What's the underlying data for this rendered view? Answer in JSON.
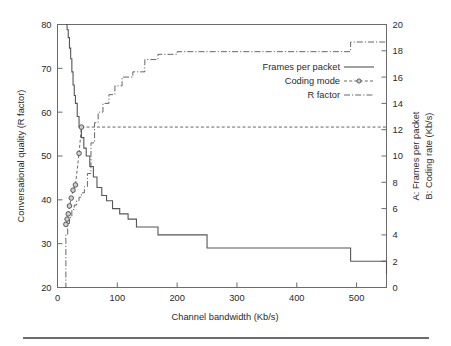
{
  "chart_data": {
    "type": "line",
    "title": "",
    "xlabel": "Channel bandwidth (Kb/s)",
    "ylabel_left": "Conversational quality (R factor)",
    "ylabel_right_a": "A: Frames per packet",
    "ylabel_right_b": "B: Coding rate (Kb/s)",
    "xlim": [
      0,
      550
    ],
    "ylim_left": [
      20,
      80
    ],
    "ylim_right": [
      0,
      20
    ],
    "xticks": [
      0,
      100,
      200,
      300,
      400,
      500
    ],
    "xtick_labels": [
      "0",
      "100",
      "200",
      "300",
      "400",
      "500"
    ],
    "yticks_left": [
      20,
      30,
      40,
      50,
      60,
      70,
      80
    ],
    "ytick_labels_left": [
      "20",
      "30",
      "40",
      "50",
      "60",
      "70",
      "80"
    ],
    "yticks_right": [
      0,
      2,
      4,
      6,
      8,
      10,
      12,
      14,
      16,
      18,
      20
    ],
    "ytick_labels_right": [
      "0",
      "2",
      "4",
      "6",
      "8",
      "10",
      "12",
      "14",
      "16",
      "18",
      "20"
    ],
    "grid": false,
    "legend_position": "center-right",
    "legend": [
      {
        "label": "Frames per packet",
        "style": "solid",
        "marker": "none"
      },
      {
        "label": "Coding mode",
        "style": "dashed",
        "marker": "circle"
      },
      {
        "label": "R factor",
        "style": "dash-dot",
        "marker": "none"
      }
    ],
    "series": [
      {
        "name": "Frames per packet",
        "axis": "right",
        "units": "frames",
        "style": "step",
        "x": [
          14,
          16,
          18,
          20,
          22,
          24,
          26,
          28,
          30,
          33,
          36,
          40,
          44,
          48,
          54,
          60,
          66,
          74,
          82,
          92,
          104,
          118,
          132,
          168,
          250,
          490,
          550
        ],
        "y": [
          20.0,
          19.6,
          19.0,
          18.2,
          17.4,
          16.4,
          15.4,
          14.6,
          14.0,
          13.0,
          12.2,
          11.4,
          10.6,
          10.0,
          9.2,
          8.4,
          7.6,
          7.0,
          6.6,
          6.0,
          5.6,
          5.2,
          4.6,
          4.0,
          3.0,
          2.0,
          1.0
        ]
      },
      {
        "name": "Coding mode",
        "axis": "right",
        "units": "Kb/s",
        "style": "dashed-with-markers",
        "x": [
          14,
          16,
          18,
          20,
          23,
          26,
          30,
          36,
          40,
          550
        ],
        "y": [
          4.8,
          5.2,
          5.6,
          6.2,
          6.8,
          7.4,
          7.8,
          10.2,
          12.2,
          12.2
        ],
        "marker_x": [
          14,
          16,
          18,
          20,
          23,
          26,
          30,
          36,
          40
        ],
        "marker_y": [
          4.8,
          5.2,
          5.6,
          6.2,
          6.8,
          7.4,
          7.8,
          10.2,
          12.2
        ]
      },
      {
        "name": "R factor",
        "axis": "left",
        "units": "R",
        "style": "step",
        "x": [
          12,
          14,
          17,
          20,
          24,
          28,
          32,
          36,
          40,
          45,
          50,
          56,
          62,
          68,
          76,
          86,
          96,
          108,
          126,
          146,
          168,
          200,
          250,
          490,
          550
        ],
        "y": [
          20.0,
          32.0,
          34.6,
          36.0,
          37.8,
          38.8,
          39.8,
          40.6,
          41.6,
          43.0,
          46.0,
          53.0,
          57.6,
          60.0,
          62.0,
          64.0,
          66.0,
          68.0,
          69.2,
          72.0,
          73.2,
          73.8,
          73.8,
          76.0,
          77.0
        ]
      }
    ],
    "annotations": []
  }
}
